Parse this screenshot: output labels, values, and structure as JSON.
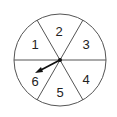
{
  "diagram": {
    "type": "spinner",
    "sections": [
      {
        "label": "1",
        "x": 35,
        "y": 49
      },
      {
        "label": "2",
        "x": 59,
        "y": 36
      },
      {
        "label": "3",
        "x": 86,
        "y": 49
      },
      {
        "label": "4",
        "x": 86,
        "y": 84
      },
      {
        "label": "5",
        "x": 60,
        "y": 97
      },
      {
        "label": "6",
        "x": 35,
        "y": 86
      }
    ],
    "pointer": {
      "points_to": "6"
    },
    "colors": {
      "stroke": "#555555",
      "arrow": "#111111"
    }
  }
}
